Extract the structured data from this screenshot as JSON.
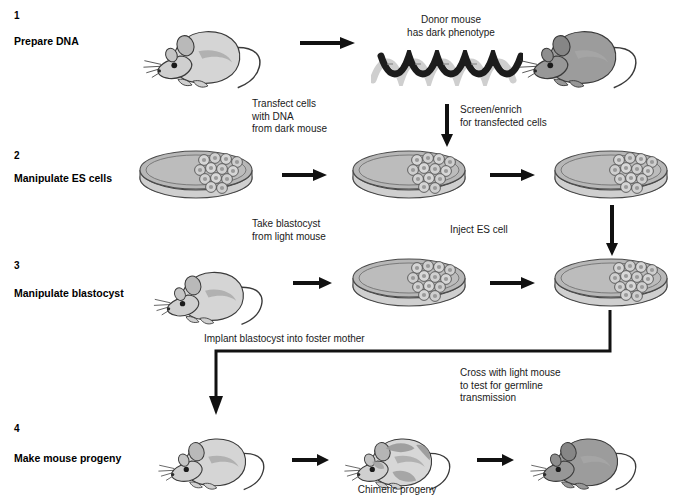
{
  "diagram": {
    "background_color": "#ffffff",
    "text_color": "#000000"
  },
  "steps": [
    {
      "number": "1",
      "label": "Prepare DNA"
    },
    {
      "number": "2",
      "label": "Manipulate ES cells"
    },
    {
      "number": "3",
      "label": "Manipulate blastocyst"
    },
    {
      "number": "4",
      "label": "Make mouse progeny"
    }
  ],
  "captions": {
    "donor_mouse": "Donor mouse\nhas dark phenotype",
    "transfect": "Transfect cells\nwith DNA\nfrom dark mouse",
    "screen_enrich": "Screen/enrich\nfor transfected cells",
    "take_blastocyst": "Take blastocyst\nfrom light mouse",
    "inject_es_cell": "Inject ES cell",
    "implant_blastocyst": "Implant blastocyst into foster mother",
    "cross_with_light": "Cross with light mouse\nto test for germline\ntransmission",
    "chimeric_progeny": "Chimeric progeny"
  },
  "icons": {
    "dna_helix": "dna-double-helix-icon",
    "petri_dish": "petri-dish-icon",
    "mouse_light": "light-mouse-icon",
    "mouse_dark": "dark-mouse-icon",
    "mouse_chimeric": "chimeric-mouse-icon",
    "arrow_right": "arrow-right-icon",
    "arrow_down": "arrow-down-icon",
    "elbow_connector": "elbow-connector-icon"
  },
  "colors": {
    "mouse_light_body": "#d4d4d4",
    "mouse_dark_body": "#9a9a9a",
    "dish_fill": "#b9b9b9",
    "dish_rim": "#d8d8d8",
    "cell_fill": "#c9c9c9",
    "dna_dark": "#1c1c1c",
    "dna_light": "#c8c8c8",
    "stroke": "#2b2b2b"
  }
}
